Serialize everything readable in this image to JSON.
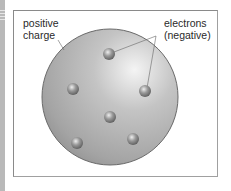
{
  "diagram": {
    "labels": {
      "positive_line1": "positive",
      "positive_line2": "charge",
      "electrons_line1": "electrons",
      "electrons_line2": "(negative)"
    },
    "sphere": {
      "cx": 110,
      "cy": 97,
      "r": 68,
      "color": "#a9a9a9"
    },
    "electrons": [
      {
        "cx": 109,
        "cy": 54
      },
      {
        "cx": 73,
        "cy": 89
      },
      {
        "cx": 145,
        "cy": 91
      },
      {
        "cx": 110,
        "cy": 117
      },
      {
        "cx": 77,
        "cy": 143
      },
      {
        "cx": 133,
        "cy": 139
      }
    ]
  }
}
